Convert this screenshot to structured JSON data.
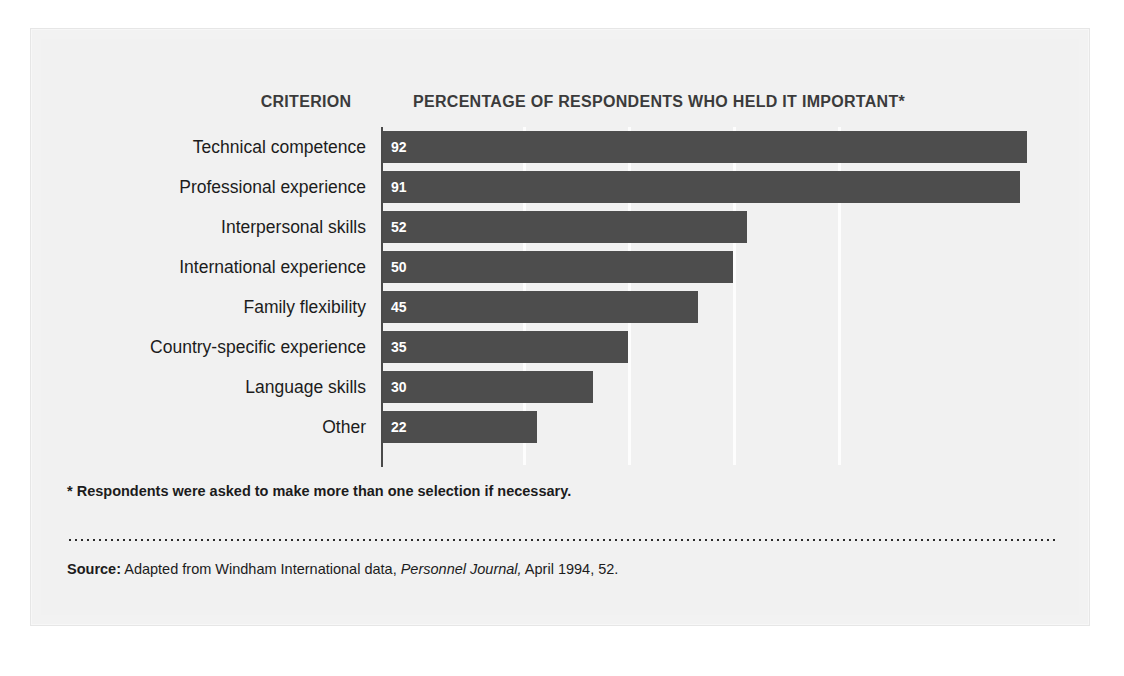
{
  "headers": {
    "criterion": "CRITERION",
    "percentage": "PERCENTAGE OF RESPONDENTS WHO HELD IT IMPORTANT*"
  },
  "footnote": "* Respondents were asked to make more than one selection if necessary.",
  "source": {
    "label": "Source:",
    "text_before_italic": " Adapted from Windham International data, ",
    "italic": "Personnel Journal,",
    "text_after_italic": " April 1994, 52."
  },
  "colors": {
    "bar": "#4d4d4d",
    "panel_background": "#f1f1f1",
    "axis": "#4a4a4a",
    "gridline": "#ffffff",
    "value_label": "#ffffff",
    "text": "#1c1c1c"
  },
  "chart_data": {
    "type": "bar",
    "orientation": "horizontal",
    "title": "PERCENTAGE OF RESPONDENTS WHO HELD IT IMPORTANT*",
    "xlabel": "",
    "ylabel": "CRITERION",
    "xlim": [
      0,
      100
    ],
    "grid": true,
    "gridline_values": [
      20,
      35,
      50,
      65
    ],
    "legend": "none",
    "categories": [
      "Technical competence",
      "Professional experience",
      "Interpersonal skills",
      "International experience",
      "Family flexibility",
      "Country-specific experience",
      "Language skills",
      "Other"
    ],
    "values": [
      92,
      91,
      52,
      50,
      45,
      35,
      30,
      22
    ],
    "value_labels": [
      "92",
      "91",
      "52",
      "50",
      "45",
      "35",
      "30",
      "22"
    ],
    "units": "percent"
  }
}
